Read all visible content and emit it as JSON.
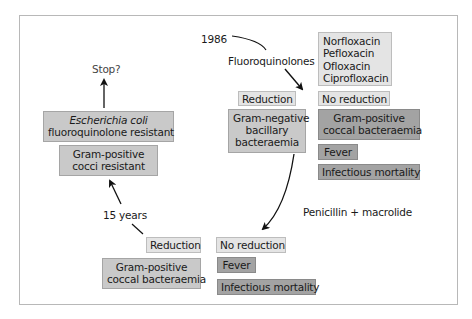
{
  "diagram": {
    "timeline": {
      "start_year": "1986",
      "interval_label": "15 years"
    },
    "first_intervention": {
      "label": "Fluoroquinolones",
      "drugs": [
        "Norfloxacin",
        "Pefloxacin",
        "Ofloxacin",
        "Ciprofloxacin"
      ],
      "reduction_label": "Reduction",
      "reduced": [
        "Gram-negative",
        "bacillary",
        "bacteraemia"
      ],
      "no_reduction_label": "No reduction",
      "not_reduced": {
        "gram_positive": [
          "Gram-positive",
          "coccal bacteraemia"
        ],
        "fever": "Fever",
        "mortality": "Infectious mortality"
      }
    },
    "second_intervention": {
      "label": "Penicillin + macrolide",
      "reduction_label": "Reduction",
      "reduced": [
        "Gram-positive",
        "coccal bacteraemia"
      ],
      "no_reduction_label": "No reduction",
      "not_reduced": {
        "fever": "Fever",
        "mortality": "Infectious mortality"
      }
    },
    "outcomes": {
      "gram_positive_resistant": [
        "Gram-positive",
        "cocci resistant"
      ],
      "ecoli_resistant": {
        "organism": "Escherichia coli",
        "status": "fluoroquinolone resistant"
      },
      "stop_label": "Stop?"
    },
    "colors": {
      "light_box": "#e4e4e4",
      "mid_box": "#c9c9c9",
      "dark_box": "#a3a3a3",
      "frame": "#b8b8b8",
      "arrow": "#111111"
    }
  }
}
